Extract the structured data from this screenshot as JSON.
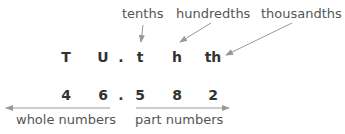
{
  "top_labels": {
    "tenths": "tenths",
    "hundredths": "hundredths",
    "thousandths": "thousandths"
  },
  "place_headers": [
    "T",
    "U",
    ".",
    "t",
    "h",
    "th"
  ],
  "digits": [
    "4",
    "6",
    ".",
    "5",
    "8",
    "2"
  ],
  "bottom_labels": {
    "whole": "whole numbers",
    "part": "part numbers"
  },
  "colors": {
    "arrow": "#999999",
    "text": "#333333",
    "label": "#555555"
  }
}
